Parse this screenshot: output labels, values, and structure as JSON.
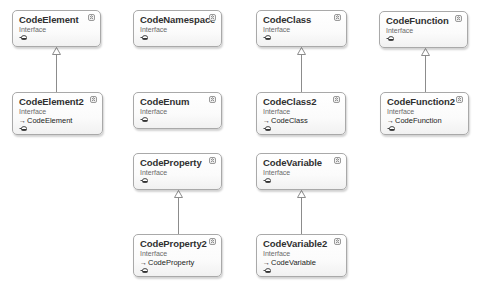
{
  "diagram": {
    "type": "class-diagram",
    "stereotype_label": "Interface",
    "nodes": [
      {
        "id": "CodeElement",
        "name": "CodeElement",
        "stereotype": "Interface",
        "base": null,
        "x": 12,
        "y": 10,
        "w": 89,
        "h": 37
      },
      {
        "id": "CodeNamespace",
        "name": "CodeNamespace",
        "stereotype": "Interface",
        "base": null,
        "x": 133,
        "y": 10,
        "w": 89,
        "h": 37
      },
      {
        "id": "CodeClass",
        "name": "CodeClass",
        "stereotype": "Interface",
        "base": null,
        "x": 256,
        "y": 10,
        "w": 91,
        "h": 37
      },
      {
        "id": "CodeFunction",
        "name": "CodeFunction",
        "stereotype": "Interface",
        "base": null,
        "x": 379,
        "y": 11,
        "w": 89,
        "h": 37
      },
      {
        "id": "CodeElement2",
        "name": "CodeElement2",
        "stereotype": "Interface",
        "base": "CodeElement",
        "x": 12,
        "y": 92,
        "w": 91,
        "h": 43
      },
      {
        "id": "CodeEnum",
        "name": "CodeEnum",
        "stereotype": "Interface",
        "base": null,
        "x": 133,
        "y": 92,
        "w": 89,
        "h": 37
      },
      {
        "id": "CodeClass2",
        "name": "CodeClass2",
        "stereotype": "Interface",
        "base": "CodeClass",
        "x": 256,
        "y": 92,
        "w": 90,
        "h": 43
      },
      {
        "id": "CodeFunction2",
        "name": "CodeFunction2",
        "stereotype": "Interface",
        "base": "CodeFunction",
        "x": 380,
        "y": 92,
        "w": 89,
        "h": 43
      },
      {
        "id": "CodeProperty",
        "name": "CodeProperty",
        "stereotype": "Interface",
        "base": null,
        "x": 133,
        "y": 153,
        "w": 89,
        "h": 37
      },
      {
        "id": "CodeVariable",
        "name": "CodeVariable",
        "stereotype": "Interface",
        "base": null,
        "x": 256,
        "y": 153,
        "w": 91,
        "h": 37
      },
      {
        "id": "CodeProperty2",
        "name": "CodeProperty2",
        "stereotype": "Interface",
        "base": "CodeProperty",
        "x": 133,
        "y": 234,
        "w": 89,
        "h": 43
      },
      {
        "id": "CodeVariable2",
        "name": "CodeVariable2",
        "stereotype": "Interface",
        "base": "CodeVariable",
        "x": 256,
        "y": 234,
        "w": 91,
        "h": 43
      }
    ],
    "edges": [
      {
        "from": "CodeElement2",
        "to": "CodeElement",
        "kind": "inheritance",
        "x": 56,
        "y1": 92,
        "y2": 47
      },
      {
        "from": "CodeClass2",
        "to": "CodeClass",
        "kind": "inheritance",
        "x": 301,
        "y1": 92,
        "y2": 47
      },
      {
        "from": "CodeFunction2",
        "to": "CodeFunction",
        "kind": "inheritance",
        "x": 425,
        "y1": 92,
        "y2": 48
      },
      {
        "from": "CodeProperty2",
        "to": "CodeProperty",
        "kind": "inheritance",
        "x": 178,
        "y1": 234,
        "y2": 190
      },
      {
        "from": "CodeVariable2",
        "to": "CodeVariable",
        "kind": "inheritance",
        "x": 301,
        "y1": 234,
        "y2": 190
      }
    ]
  },
  "labels": {
    "CodeElement": {
      "name": "CodeElement",
      "stereotype": "Interface"
    },
    "CodeNamespace": {
      "name": "CodeNamespace",
      "stereotype": "Interface"
    },
    "CodeClass": {
      "name": "CodeClass",
      "stereotype": "Interface"
    },
    "CodeFunction": {
      "name": "CodeFunction",
      "stereotype": "Interface"
    },
    "CodeElement2": {
      "name": "CodeElement2",
      "stereotype": "Interface",
      "base": "CodeElement"
    },
    "CodeEnum": {
      "name": "CodeEnum",
      "stereotype": "Interface"
    },
    "CodeClass2": {
      "name": "CodeClass2",
      "stereotype": "Interface",
      "base": "CodeClass"
    },
    "CodeFunction2": {
      "name": "CodeFunction2",
      "stereotype": "Interface",
      "base": "CodeFunction"
    },
    "CodeProperty": {
      "name": "CodeProperty",
      "stereotype": "Interface"
    },
    "CodeVariable": {
      "name": "CodeVariable",
      "stereotype": "Interface"
    },
    "CodeProperty2": {
      "name": "CodeProperty2",
      "stereotype": "Interface",
      "base": "CodeProperty"
    },
    "CodeVariable2": {
      "name": "CodeVariable2",
      "stereotype": "Interface",
      "base": "CodeVariable"
    }
  },
  "icons": {
    "collapse": "double-chevron-up-icon",
    "interface": "lollipop-interface-icon",
    "inherits_arrow": "→"
  },
  "colors": {
    "box_border": "#a9a9a9",
    "box_fill_top": "#ffffff",
    "box_fill_bottom": "#f1f1f1",
    "name_text": "#303030",
    "stereotype_text": "#6a6a6a",
    "connector": "#8c8c8c"
  }
}
